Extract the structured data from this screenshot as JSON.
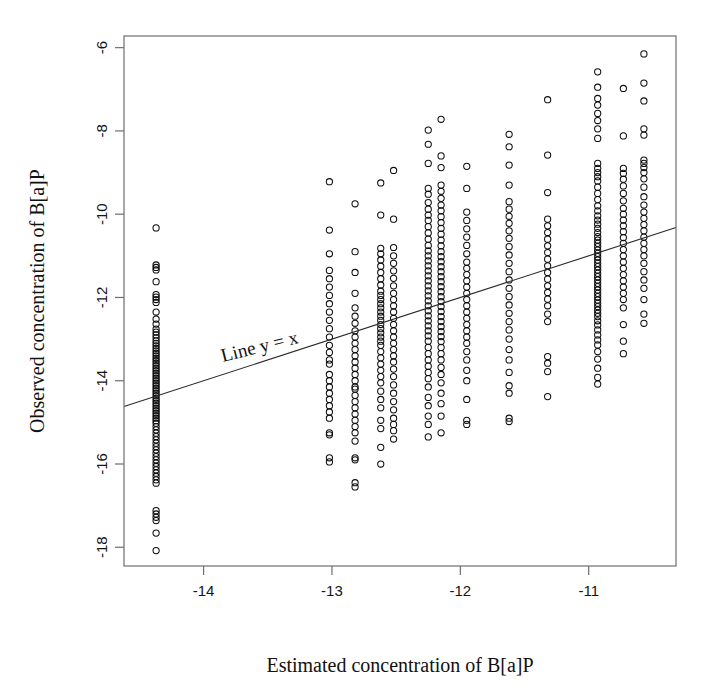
{
  "chart_data": {
    "type": "scatter",
    "title": "",
    "xlabel": "Estimated concentration of B[a]P",
    "ylabel": "Observed concentration of B[a]P",
    "xlim": [
      -14.62,
      -10.32
    ],
    "ylim": [
      -18.45,
      -5.72
    ],
    "xticks": [
      -14,
      -13,
      -12,
      -11
    ],
    "xtick_labels": [
      "-14",
      "-13",
      "-12",
      "-11"
    ],
    "yticks": [
      -6,
      -8,
      -10,
      -12,
      -14,
      -16,
      -18
    ],
    "ytick_labels": [
      "-6",
      "-8",
      "-10",
      "-12",
      "-14",
      "-16",
      "-18"
    ],
    "grid": false,
    "legend": null,
    "marker": "open-circle",
    "marker_color": "#0d0d0d",
    "background_color": "#ffffff",
    "frame_color": "#6e6e6e",
    "annotations": [
      {
        "text": "Line y = x",
        "x": -13.85,
        "y": -13.55,
        "rotation_deg": -14
      }
    ],
    "reference_line": {
      "label": "Line y = x",
      "slope": 1.0,
      "intercept": 0.0,
      "x_start": -14.62,
      "y_start": -14.62,
      "x_end": -10.32,
      "y_end": -10.32,
      "color": "#2b2b2b"
    },
    "columns": [
      {
        "x": -14.37,
        "values": [
          -10.33,
          -11.22,
          -11.28,
          -11.34,
          -11.62,
          -11.93,
          -11.99,
          -12.05,
          -12.12,
          -12.35,
          -12.52,
          -12.64,
          -12.76,
          -12.83,
          -12.9,
          -12.97,
          -13.04,
          -13.1,
          -13.16,
          -13.22,
          -13.28,
          -13.34,
          -13.4,
          -13.46,
          -13.52,
          -13.58,
          -13.64,
          -13.7,
          -13.76,
          -13.82,
          -13.88,
          -13.94,
          -14.0,
          -14.06,
          -14.12,
          -14.18,
          -14.24,
          -14.3,
          -14.36,
          -14.42,
          -14.48,
          -14.54,
          -14.6,
          -14.66,
          -14.72,
          -14.78,
          -14.84,
          -14.9,
          -14.96,
          -15.02,
          -15.1,
          -15.18,
          -15.26,
          -15.34,
          -15.42,
          -15.5,
          -15.58,
          -15.66,
          -15.74,
          -15.82,
          -15.9,
          -15.98,
          -16.06,
          -16.14,
          -16.22,
          -16.3,
          -16.38,
          -16.46,
          -17.12,
          -17.2,
          -17.28,
          -17.36,
          -17.66,
          -18.08
        ]
      },
      {
        "x": -13.02,
        "values": [
          -9.22,
          -10.38,
          -10.95,
          -11.35,
          -11.55,
          -11.75,
          -11.95,
          -12.15,
          -12.35,
          -12.55,
          -12.75,
          -12.95,
          -13.15,
          -13.32,
          -13.5,
          -13.6,
          -13.85,
          -14.0,
          -14.15,
          -14.3,
          -14.45,
          -14.6,
          -14.75,
          -14.9,
          -15.25,
          -15.3,
          -15.85,
          -15.95
        ]
      },
      {
        "x": -12.82,
        "values": [
          -9.75,
          -10.9,
          -11.4,
          -11.9,
          -12.25,
          -12.45,
          -12.62,
          -12.8,
          -12.95,
          -13.1,
          -13.25,
          -13.4,
          -13.55,
          -13.7,
          -13.85,
          -14.0,
          -14.15,
          -14.2,
          -14.35,
          -14.5,
          -14.65,
          -14.8,
          -14.95,
          -15.1,
          -15.25,
          -15.45,
          -15.85,
          -15.9,
          -16.45,
          -16.55
        ]
      },
      {
        "x": -12.62,
        "values": [
          -9.25,
          -10.02,
          -10.82,
          -10.95,
          -11.1,
          -11.25,
          -11.4,
          -11.55,
          -11.7,
          -11.85,
          -11.95,
          -12.05,
          -12.15,
          -12.25,
          -12.35,
          -12.45,
          -12.55,
          -12.65,
          -12.75,
          -12.85,
          -12.95,
          -13.05,
          -13.15,
          -13.3,
          -13.45,
          -13.6,
          -13.75,
          -13.9,
          -14.05,
          -14.25,
          -14.45,
          -14.65,
          -14.95,
          -15.15,
          -15.6,
          -16.0
        ]
      },
      {
        "x": -12.52,
        "values": [
          -8.95,
          -10.12,
          -10.8,
          -11.0,
          -11.18,
          -11.36,
          -11.54,
          -11.72,
          -11.9,
          -12.05,
          -12.2,
          -12.35,
          -12.5,
          -12.65,
          -12.8,
          -12.95,
          -13.1,
          -13.25,
          -13.4,
          -13.55,
          -13.72,
          -13.9,
          -14.1,
          -14.3,
          -14.5,
          -14.7,
          -14.9,
          -15.05,
          -15.2,
          -15.4
        ]
      },
      {
        "x": -12.25,
        "values": [
          -7.98,
          -8.32,
          -8.78,
          -9.38,
          -9.52,
          -9.72,
          -9.88,
          -10.02,
          -10.15,
          -10.3,
          -10.45,
          -10.6,
          -10.75,
          -10.88,
          -11.0,
          -11.12,
          -11.24,
          -11.36,
          -11.48,
          -11.6,
          -11.72,
          -11.84,
          -11.96,
          -12.08,
          -12.2,
          -12.32,
          -12.44,
          -12.56,
          -12.68,
          -12.8,
          -12.92,
          -13.05,
          -13.2,
          -13.35,
          -13.5,
          -13.65,
          -13.8,
          -13.95,
          -14.15,
          -14.4,
          -14.6,
          -14.85,
          -15.05,
          -15.35
        ]
      },
      {
        "x": -12.15,
        "values": [
          -7.72,
          -8.6,
          -8.88,
          -9.3,
          -9.45,
          -9.62,
          -9.78,
          -9.92,
          -10.06,
          -10.2,
          -10.34,
          -10.48,
          -10.62,
          -10.76,
          -10.9,
          -11.02,
          -11.14,
          -11.26,
          -11.38,
          -11.5,
          -11.62,
          -11.74,
          -11.86,
          -11.98,
          -12.1,
          -12.22,
          -12.34,
          -12.46,
          -12.58,
          -12.7,
          -12.82,
          -12.94,
          -13.06,
          -13.2,
          -13.35,
          -13.5,
          -13.68,
          -13.85,
          -14.05,
          -14.3,
          -14.55,
          -14.85,
          -15.25
        ]
      },
      {
        "x": -11.95,
        "values": [
          -8.85,
          -9.38,
          -9.95,
          -10.15,
          -10.35,
          -10.55,
          -10.75,
          -10.95,
          -11.15,
          -11.3,
          -11.45,
          -11.6,
          -11.75,
          -11.9,
          -12.05,
          -12.2,
          -12.35,
          -12.5,
          -12.65,
          -12.8,
          -12.95,
          -13.1,
          -13.3,
          -13.5,
          -13.75,
          -14.0,
          -14.45,
          -14.95,
          -15.05
        ]
      },
      {
        "x": -11.62,
        "values": [
          -8.08,
          -8.38,
          -8.82,
          -9.3,
          -9.7,
          -9.88,
          -10.05,
          -10.22,
          -10.4,
          -10.58,
          -10.78,
          -10.98,
          -11.18,
          -11.38,
          -11.58,
          -11.78,
          -11.98,
          -12.18,
          -12.38,
          -12.58,
          -12.78,
          -13.0,
          -13.25,
          -13.5,
          -13.8,
          -14.12,
          -14.3,
          -14.9,
          -14.98
        ]
      },
      {
        "x": -11.32,
        "values": [
          -7.25,
          -8.58,
          -9.48,
          -10.12,
          -10.28,
          -10.44,
          -10.6,
          -10.76,
          -10.92,
          -11.08,
          -11.24,
          -11.4,
          -11.56,
          -11.72,
          -11.88,
          -12.04,
          -12.2,
          -12.4,
          -12.58,
          -13.42,
          -13.58,
          -13.78,
          -14.38
        ]
      },
      {
        "x": -10.93,
        "values": [
          -6.58,
          -6.95,
          -7.22,
          -7.38,
          -7.58,
          -7.75,
          -7.95,
          -8.18,
          -8.78,
          -8.9,
          -9.0,
          -9.1,
          -9.2,
          -9.35,
          -9.5,
          -9.65,
          -9.8,
          -9.92,
          -10.04,
          -10.14,
          -10.24,
          -10.34,
          -10.44,
          -10.54,
          -10.62,
          -10.7,
          -10.78,
          -10.86,
          -10.94,
          -11.02,
          -11.1,
          -11.18,
          -11.26,
          -11.34,
          -11.42,
          -11.5,
          -11.58,
          -11.66,
          -11.74,
          -11.82,
          -11.9,
          -11.98,
          -12.06,
          -12.14,
          -12.22,
          -12.3,
          -12.38,
          -12.46,
          -12.56,
          -12.66,
          -12.78,
          -12.9,
          -13.02,
          -13.14,
          -13.3,
          -13.48,
          -13.7,
          -13.92,
          -14.08
        ]
      },
      {
        "x": -10.73,
        "values": [
          -6.98,
          -8.12,
          -8.9,
          -9.02,
          -9.16,
          -9.32,
          -9.5,
          -9.68,
          -9.86,
          -10.0,
          -10.14,
          -10.28,
          -10.42,
          -10.56,
          -10.7,
          -10.85,
          -11.0,
          -11.15,
          -11.3,
          -11.45,
          -11.6,
          -11.75,
          -11.9,
          -12.05,
          -12.25,
          -12.65,
          -13.05,
          -13.35
        ]
      },
      {
        "x": -10.57,
        "values": [
          -6.15,
          -6.85,
          -7.28,
          -7.95,
          -8.1,
          -8.7,
          -8.78,
          -8.88,
          -9.0,
          -9.15,
          -9.35,
          -9.58,
          -9.78,
          -9.95,
          -10.1,
          -10.25,
          -10.4,
          -10.55,
          -10.7,
          -10.85,
          -11.0,
          -11.18,
          -11.38,
          -11.58,
          -11.78,
          -12.05,
          -12.4,
          -12.62
        ]
      }
    ]
  },
  "geometry": {
    "plot_left": 124,
    "plot_right": 676,
    "plot_top": 36,
    "plot_bottom": 566
  }
}
